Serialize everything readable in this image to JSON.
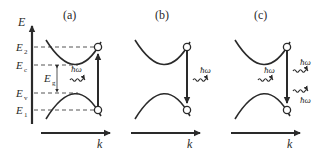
{
  "figure": {
    "colors": {
      "ink": "#2a2a2a",
      "dash": "#555555",
      "background": "#ffffff"
    },
    "panels": [
      {
        "id": "a",
        "label": "(a)",
        "process": "absorption",
        "photons": [
          {
            "label": "ħω",
            "direction": "in"
          }
        ],
        "transition": "up"
      },
      {
        "id": "b",
        "label": "(b)",
        "process": "spontaneous emission",
        "photons": [
          {
            "label": "ħω",
            "direction": "out"
          }
        ],
        "transition": "down"
      },
      {
        "id": "c",
        "label": "(c)",
        "process": "stimulated emission",
        "photons": [
          {
            "label": "ħω",
            "direction": "in"
          },
          {
            "label": "ħω",
            "direction": "out"
          },
          {
            "label": "ħω",
            "direction": "out"
          }
        ],
        "transition": "down"
      }
    ],
    "axes": {
      "energy_axis_label": "E",
      "momentum_axis_label": "k"
    },
    "energy_levels": {
      "E2": {
        "main": "E",
        "sub": "2"
      },
      "Ec": {
        "main": "E",
        "sub": "c"
      },
      "Ev": {
        "main": "E",
        "sub": "v"
      },
      "E1": {
        "main": "E",
        "sub": "1"
      }
    },
    "gap_label": {
      "main": "E",
      "sub": "g"
    }
  }
}
